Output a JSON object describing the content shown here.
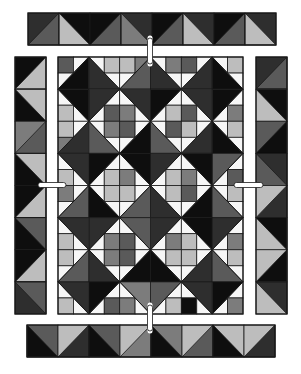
{
  "diagram": {
    "kind": "quilt-assembly",
    "palette": {
      "black": "#0e0e0e",
      "dark": "#2e2e2e",
      "mid": "#5a5a5a",
      "gray": "#7c7c7c",
      "light": "#bdbdbd",
      "white": "#f6f6f6",
      "line": "#1a1a1a",
      "pin": "#ffffff"
    },
    "center": {
      "x": 58,
      "y": 57,
      "width": 185,
      "height": 257,
      "block_cols": 3,
      "block_rows": 4,
      "cells_per_block": 4,
      "cell_colors": [
        [
          "mid",
          "white",
          "white",
          "light",
          "light",
          "gray",
          "white",
          "gray",
          "mid",
          "white",
          "white",
          "light"
        ],
        [
          "white",
          "light",
          "gray",
          "white",
          "white",
          "light",
          "light",
          "white",
          "white",
          "gray",
          "light",
          "white"
        ],
        [
          "white",
          "gray",
          "light",
          "white",
          "white",
          "mid",
          "gray",
          "white",
          "white",
          "light",
          "gray",
          "white"
        ],
        [
          "light",
          "white",
          "white",
          "mid",
          "gray",
          "white",
          "white",
          "light",
          "mid",
          "white",
          "white",
          "gray"
        ],
        [
          "light",
          "white",
          "white",
          "gray",
          "mid",
          "white",
          "white",
          "mid",
          "light",
          "white",
          "white",
          "light"
        ],
        [
          "gray",
          "light",
          "mid",
          "white",
          "white",
          "black",
          "light",
          "white",
          "white",
          "gray",
          "light",
          "white"
        ],
        [
          "white",
          "gray",
          "light",
          "white",
          "white",
          "gray",
          "gray",
          "white",
          "white",
          "mid",
          "gray",
          "white"
        ],
        [
          "light",
          "white",
          "white",
          "light",
          "gray",
          "white",
          "white",
          "light",
          "gray",
          "white",
          "white",
          "mid"
        ],
        [
          "gray",
          "white",
          "white",
          "light",
          "light",
          "white",
          "white",
          "light",
          "mid",
          "white",
          "white",
          "light"
        ],
        [
          "white",
          "light",
          "gray",
          "white",
          "white",
          "gray",
          "light",
          "white",
          "white",
          "light",
          "gray",
          "white"
        ],
        [
          "white",
          "gray",
          "light",
          "white",
          "white",
          "light",
          "mid",
          "white",
          "white",
          "gray",
          "light",
          "white"
        ],
        [
          "light",
          "white",
          "white",
          "gray",
          "mid",
          "white",
          "white",
          "gray",
          "light",
          "white",
          "white",
          "gray"
        ],
        [
          "light",
          "white",
          "white",
          "gray",
          "mid",
          "white",
          "white",
          "light",
          "light",
          "white",
          "white",
          "light"
        ],
        [
          "white",
          "light",
          "mid",
          "white",
          "white",
          "light",
          "gray",
          "white",
          "white",
          "mid",
          "light",
          "white"
        ],
        [
          "white",
          "gray",
          "light",
          "white",
          "white",
          "gray",
          "light",
          "white",
          "white",
          "light",
          "gray",
          "white"
        ],
        [
          "light",
          "white",
          "white",
          "mid",
          "gray",
          "white",
          "white",
          "light",
          "black",
          "white",
          "white",
          "gray"
        ]
      ],
      "diamonds": [
        [
          [
            "black",
            "dark",
            "dark",
            "black"
          ],
          [
            "mid",
            "dark",
            "black",
            "dark"
          ],
          [
            "dark",
            "black",
            "black",
            "dark"
          ]
        ],
        [
          [
            "dark",
            "mid",
            "black",
            "dark"
          ],
          [
            "black",
            "mid",
            "dark",
            "black"
          ],
          [
            "dark",
            "black",
            "mid",
            "black"
          ]
        ],
        [
          [
            "mid",
            "black",
            "dark",
            "dark"
          ],
          [
            "mid",
            "dark",
            "dark",
            "mid"
          ],
          [
            "black",
            "mid",
            "dark",
            "black"
          ]
        ],
        [
          [
            "mid",
            "dark",
            "black",
            "dark"
          ],
          [
            "black",
            "black",
            "mid",
            "gray"
          ],
          [
            "dark",
            "mid",
            "black",
            "dark"
          ]
        ]
      ]
    },
    "borders": {
      "top": {
        "x": 28,
        "y": 13,
        "width": 248,
        "height": 32,
        "orientation": "horizontal",
        "units": [
          {
            "a": "dark",
            "b": "mid",
            "dir": "up"
          },
          {
            "a": "black",
            "b": "light",
            "dir": "down"
          },
          {
            "a": "black",
            "b": "mid",
            "dir": "up"
          },
          {
            "a": "dark",
            "b": "gray",
            "dir": "down"
          },
          {
            "a": "black",
            "b": "mid",
            "dir": "up"
          },
          {
            "a": "dark",
            "b": "light",
            "dir": "down"
          },
          {
            "a": "black",
            "b": "mid",
            "dir": "up"
          },
          {
            "a": "dark",
            "b": "light",
            "dir": "down"
          }
        ]
      },
      "bottom": {
        "x": 27,
        "y": 325,
        "width": 248,
        "height": 32,
        "orientation": "horizontal",
        "units": [
          {
            "a": "mid",
            "b": "black",
            "dir": "down"
          },
          {
            "a": "light",
            "b": "dark",
            "dir": "up"
          },
          {
            "a": "mid",
            "b": "black",
            "dir": "down"
          },
          {
            "a": "light",
            "b": "gray",
            "dir": "up"
          },
          {
            "a": "gray",
            "b": "black",
            "dir": "down"
          },
          {
            "a": "light",
            "b": "mid",
            "dir": "up"
          },
          {
            "a": "light",
            "b": "black",
            "dir": "down"
          },
          {
            "a": "light",
            "b": "dark",
            "dir": "up"
          }
        ]
      },
      "left": {
        "x": 15,
        "y": 57,
        "width": 31,
        "height": 257,
        "orientation": "vertical",
        "units": [
          {
            "a": "black",
            "b": "light",
            "dir": "left"
          },
          {
            "a": "black",
            "b": "light",
            "dir": "right"
          },
          {
            "a": "gray",
            "b": "mid",
            "dir": "left"
          },
          {
            "a": "black",
            "b": "light",
            "dir": "right"
          },
          {
            "a": "black",
            "b": "light",
            "dir": "left"
          },
          {
            "a": "black",
            "b": "mid",
            "dir": "right"
          },
          {
            "a": "black",
            "b": "light",
            "dir": "left"
          },
          {
            "a": "dark",
            "b": "mid",
            "dir": "right"
          }
        ]
      },
      "right": {
        "x": 256,
        "y": 57,
        "width": 31,
        "height": 257,
        "orientation": "vertical",
        "units": [
          {
            "a": "dark",
            "b": "mid",
            "dir": "left"
          },
          {
            "a": "light",
            "b": "black",
            "dir": "right"
          },
          {
            "a": "mid",
            "b": "black",
            "dir": "left"
          },
          {
            "a": "mid",
            "b": "dark",
            "dir": "right"
          },
          {
            "a": "light",
            "b": "dark",
            "dir": "left"
          },
          {
            "a": "light",
            "b": "black",
            "dir": "right"
          },
          {
            "a": "light",
            "b": "black",
            "dir": "left"
          },
          {
            "a": "light",
            "b": "dark",
            "dir": "right"
          }
        ]
      }
    },
    "connectors": [
      {
        "name": "top-connector",
        "x1": 150,
        "y1": 38,
        "x2": 150,
        "y2": 64,
        "orientation": "vertical"
      },
      {
        "name": "bottom-connector",
        "x1": 150,
        "y1": 305,
        "x2": 150,
        "y2": 331,
        "orientation": "vertical"
      },
      {
        "name": "left-connector",
        "x1": 38,
        "y1": 185,
        "x2": 66,
        "y2": 185,
        "orientation": "horizontal"
      },
      {
        "name": "right-connector",
        "x1": 234,
        "y1": 185,
        "x2": 263,
        "y2": 185,
        "orientation": "horizontal"
      }
    ]
  }
}
